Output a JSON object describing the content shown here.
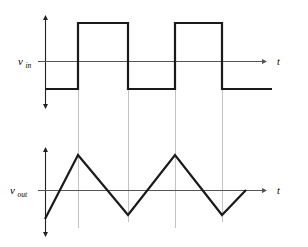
{
  "figure": {
    "title": "",
    "background_color": "#ffffff",
    "trace_color": "#1a1a1a",
    "axis_color": "#555555",
    "guide_color": "#b8b8b8"
  },
  "panels": [
    {
      "id": "input-panel",
      "y_axis_label_main": "v",
      "y_axis_label_sub": "in",
      "x_axis_label": "t",
      "waveform": "square"
    },
    {
      "id": "output-panel",
      "y_axis_label_main": "v",
      "y_axis_label_sub": "out",
      "x_axis_label": "t",
      "waveform": "triangle"
    }
  ],
  "chart_data": [
    {
      "type": "line",
      "title": "",
      "subtitle": "",
      "xlabel": "t",
      "ylabel": "v_in",
      "grid": false,
      "legend": null,
      "series": [
        {
          "name": "v_in",
          "comment": "bipolar square wave, levels -1 and +1, pixel x/y pairs",
          "points": [
            [
              45,
              89
            ],
            [
              78,
              89
            ],
            [
              78,
              23
            ],
            [
              128,
              23
            ],
            [
              128,
              89
            ],
            [
              175,
              89
            ],
            [
              175,
              23
            ],
            [
              222,
              23
            ],
            [
              222,
              89
            ],
            [
              272,
              89
            ]
          ],
          "levels": {
            "high": 1,
            "low": -1
          },
          "transitions_x": [
            78,
            128,
            175,
            222
          ]
        }
      ],
      "axis": {
        "x_line_y": 61,
        "y_line_x": 45,
        "x_start": 38,
        "x_end": 268,
        "y_top": 12,
        "y_bottom": 112
      }
    },
    {
      "type": "line",
      "title": "",
      "subtitle": "",
      "xlabel": "t",
      "ylabel": "v_out",
      "grid": false,
      "legend": null,
      "series": [
        {
          "name": "v_out",
          "comment": "triangle wave integrator output, pixel x/y pairs",
          "points": [
            [
              45,
              219
            ],
            [
              78,
              155
            ],
            [
              128,
              215
            ],
            [
              175,
              155
            ],
            [
              222,
              215
            ],
            [
              246,
              190
            ]
          ],
          "peaks_x": [
            78,
            175
          ],
          "valleys_x": [
            128,
            222
          ]
        }
      ],
      "axis": {
        "x_line_y": 190,
        "y_line_x": 45,
        "x_start": 38,
        "x_end": 268,
        "y_top": 145,
        "y_bottom": 240
      }
    }
  ],
  "guides": {
    "label": "vertical-alignment-guides",
    "x_positions": [
      78,
      128,
      175,
      222
    ],
    "y_top": 23,
    "y_bottom": 228
  }
}
